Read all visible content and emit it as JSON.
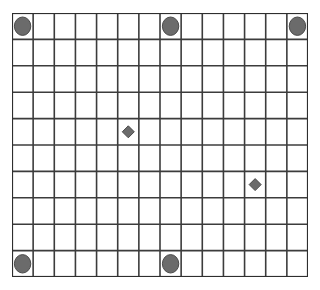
{
  "figure": {
    "background_color": "#ffffff",
    "grid": {
      "columns": 14,
      "rows": 10,
      "origin_x": 12,
      "origin_y": 13,
      "width": 296,
      "height": 264,
      "cell_width": 21.14,
      "cell_height": 26.4,
      "line_color": "#3c3c3c",
      "line_width": 1.6,
      "border_color": "#2e2e2e",
      "border_width": 2.2,
      "cell_fill": "#ffffff"
    },
    "markers": {
      "circle": {
        "shape_name": "filled-circle",
        "fill_color": "#6b6b6b",
        "stroke_color": "#4a4a4a",
        "radius_x": 8.2,
        "radius_y": 9.2,
        "count": 5,
        "points": [
          {
            "label": "top-left-circle",
            "col": 0,
            "row": 0
          },
          {
            "label": "top-mid-circle",
            "col": 7,
            "row": 0
          },
          {
            "label": "top-right-circle",
            "col": 13,
            "row": 0
          },
          {
            "label": "bottom-left-circle",
            "col": 0,
            "row": 9
          },
          {
            "label": "bottom-mid-circle",
            "col": 7,
            "row": 9
          }
        ]
      },
      "diamond": {
        "shape_name": "filled-diamond",
        "fill_color": "#6b6b6b",
        "stroke_color": "#4a4a4a",
        "half_size": 6.0,
        "count": 2,
        "points": [
          {
            "label": "upper-diamond",
            "col": 5,
            "row": 4
          },
          {
            "label": "lower-diamond",
            "col": 11,
            "row": 6
          }
        ]
      }
    }
  }
}
